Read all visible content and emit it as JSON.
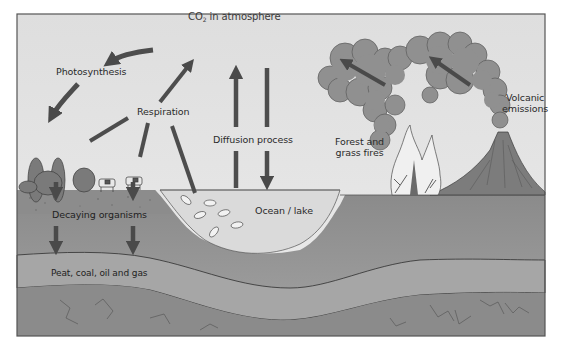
{
  "diagram": {
    "labels": {
      "co2_prefix": "CO",
      "co2_sub": "2",
      "co2_suffix": " in atmosphere",
      "photosynthesis": "Photosynthesis",
      "respiration": "Respiration",
      "diffusion": "Diffusion process",
      "forest_fires_line1": "Forest and",
      "forest_fires_line2": "grass fires",
      "volcanic_line1": "Volcanic",
      "volcanic_line2": "emissions",
      "decaying": "Decaying organisms",
      "ocean": "Ocean / lake",
      "fossil": "Peat, coal, oil and gas"
    },
    "nodes": [
      "CO2 in atmosphere",
      "Photosynthesis",
      "Respiration",
      "Diffusion process",
      "Forest and grass fires",
      "Volcanic emissions",
      "Decaying organisms",
      "Ocean / lake",
      "Peat, coal, oil and gas"
    ],
    "edges": [
      {
        "from": "CO2 in atmosphere",
        "to": "Photosynthesis"
      },
      {
        "from": "Photosynthesis",
        "to": "Plants"
      },
      {
        "from": "Respiration",
        "to": "CO2 in atmosphere"
      },
      {
        "from": "Plants",
        "to": "Respiration"
      },
      {
        "from": "Animals",
        "to": "Respiration"
      },
      {
        "from": "Fish",
        "to": "Respiration"
      },
      {
        "from": "Ocean / lake",
        "to": "CO2 in atmosphere",
        "label": "Diffusion process"
      },
      {
        "from": "CO2 in atmosphere",
        "to": "Ocean / lake",
        "label": "Diffusion process"
      },
      {
        "from": "Forest and grass fires",
        "to": "CO2 in atmosphere"
      },
      {
        "from": "Volcanic emissions",
        "to": "CO2 in atmosphere"
      },
      {
        "from": "Land surface",
        "to": "Decaying organisms"
      },
      {
        "from": "Decaying organisms",
        "to": "Peat, coal, oil and gas"
      }
    ],
    "colors": {
      "sky": "#e4e4e4",
      "surface_soil": "#8e8e8e",
      "upper_layer": "#9c9c9c",
      "fossil_layer": "#a3a3a3",
      "bedrock": "#8a8a8a",
      "water": "#dcdcdc",
      "arrow": "#4d4d4d",
      "smoke": "#8f8f8f",
      "frame": "#555555"
    }
  }
}
